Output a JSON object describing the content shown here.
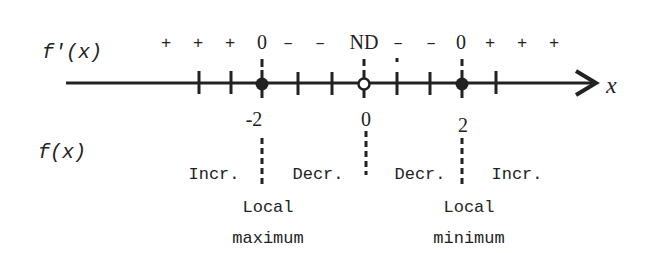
{
  "diagram": {
    "colors": {
      "ink": "#222222",
      "background": "#ffffff"
    },
    "row_labels": {
      "derivative": "f'(x)",
      "function": "f(x)"
    },
    "axis": {
      "variable": "x",
      "ticks_count": 8
    },
    "derivative_signs": [
      "+",
      "+",
      "+",
      "0",
      "–",
      "–",
      "ND",
      "–",
      "–",
      "0",
      "+",
      "+",
      "+"
    ],
    "critical_points": [
      {
        "x_label": "-2",
        "marker": "filled",
        "derivative": "0",
        "classification_line1": "Local",
        "classification_line2": "maximum"
      },
      {
        "x_label": "0",
        "marker": "open",
        "derivative": "ND"
      },
      {
        "x_label": "2",
        "marker": "filled",
        "derivative": "0",
        "classification_line1": "Local",
        "classification_line2": "minimum"
      }
    ],
    "intervals": [
      {
        "behavior": "Incr."
      },
      {
        "behavior": "Decr."
      },
      {
        "behavior": "Decr."
      },
      {
        "behavior": "Incr."
      }
    ]
  }
}
